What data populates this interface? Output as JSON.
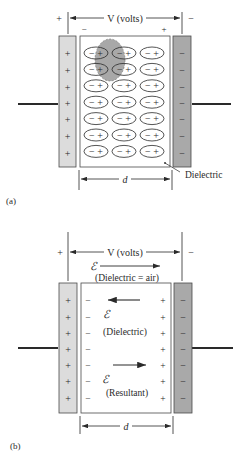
{
  "figure_a": {
    "label": "(a)",
    "voltage_label": "V (volts)",
    "left_terminal_sign": "+",
    "right_terminal_sign": "−",
    "dielectric_left_sign": "−",
    "dielectric_right_sign": "+",
    "left_plate_charges": [
      "+",
      "+",
      "+",
      "+",
      "+",
      "+",
      "+"
    ],
    "right_plate_charges": [
      "−",
      "−",
      "−",
      "−",
      "−",
      "−",
      "−"
    ],
    "dipole_rows": 7,
    "dipole_cols": 3,
    "dipole_text": "−+",
    "dielectric_callout": "Dielectric",
    "distance_label": "d"
  },
  "figure_b": {
    "label": "(b)",
    "voltage_label": "V (volts)",
    "left_terminal_sign": "+",
    "right_terminal_sign": "−",
    "field_symbol": "ℰ",
    "field_air_label": "(Dielectric = air)",
    "field_dielectric_label": "(Dielectric)",
    "field_resultant_label": "(Resultant)",
    "left_plate_charges": [
      "+",
      "+",
      "+",
      "+",
      "+",
      "+",
      "+"
    ],
    "right_plate_charges": [
      "−",
      "−",
      "−",
      "−",
      "−",
      "−",
      "−"
    ],
    "dielectric_left_charges": [
      "−",
      "−",
      "−",
      "−",
      "−",
      "−",
      "−"
    ],
    "dielectric_right_charges": [
      "+",
      "+",
      "+",
      "+",
      "+",
      "+",
      "+"
    ],
    "distance_label": "d"
  },
  "colors": {
    "left_plate": "#dcdcdc",
    "right_plate": "#a9a9a9",
    "highlight_ellipse": "#9a9a9a",
    "line": "#2a2a2a"
  }
}
